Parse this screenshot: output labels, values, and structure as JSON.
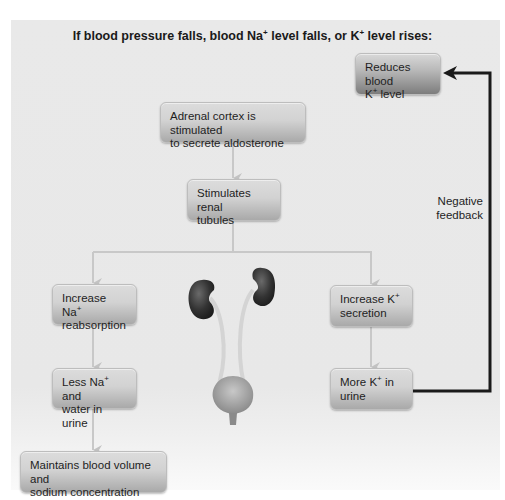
{
  "title": {
    "part1": "If blood pressure falls, blood Na",
    "sup1": "+",
    "part2": " level falls, or K",
    "sup2": "+",
    "part3": " level rises:"
  },
  "nodes": {
    "adrenal": {
      "line1": "Adrenal cortex is stimulated",
      "line2": "to secrete aldosterone"
    },
    "renal": {
      "line1": "Stimulates renal",
      "line2": "tubules"
    },
    "na_reabsorption": {
      "line1_text": "Increase Na",
      "line1_sup": "+",
      "line2": "reabsorption"
    },
    "less_na": {
      "line1_text": "Less Na",
      "line1_sup": "+",
      "line1_after": " and",
      "line2": "water in urine"
    },
    "maintains": {
      "line1": "Maintains blood volume and",
      "line2": "sodium concentration"
    },
    "k_secretion": {
      "line1_text": "Increase K",
      "line1_sup": "+",
      "line2": "secretion"
    },
    "more_k": {
      "line1_text": "More K",
      "line1_sup": "+",
      "line1_after": " in",
      "line2": "urine"
    },
    "reduces_k": {
      "line1": "Reduces blood",
      "line2_text": "K",
      "line2_sup": "+",
      "line2_after": " level"
    }
  },
  "feedback_label": {
    "line1": "Negative",
    "line2": "feedback"
  },
  "illustration": {
    "name": "kidneys, ureters and bladder"
  },
  "colors": {
    "panel": "#e8e8e8",
    "box_top": "#dcdcdc",
    "box_bottom": "#a9a9a9",
    "connector": "#c2c2c2",
    "feedback_arrow": "#1a1a1a",
    "kidney": "#3a3a3a",
    "bladder": "#9a9a9a"
  }
}
